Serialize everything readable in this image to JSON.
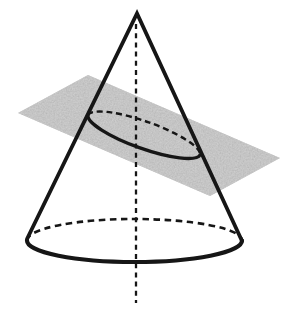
{
  "figure": {
    "type": "cone-plane-intersection",
    "canvas": {
      "width": 301,
      "height": 313
    },
    "colors": {
      "background": "#ffffff",
      "line": "#161616",
      "plane_fill": "#b1b1b1"
    },
    "plane": {
      "points": "88,75 280,158 210,196 18,113"
    },
    "cone": {
      "outline_path": "M 27 239 L 137 13.5 L 242 241",
      "base_front_path": "M 27 240.5 A 107.5 21.5 0 0 0 242 240.5",
      "base_back_path": "M 27 240.5 A 107.5 21.5 0 0 1 242 240.5"
    },
    "section_ellipse": {
      "front_path": "M 88 115 A 59.5 14 19.6 0 0 200 155",
      "back_path": "M 88 115 A 59.5 14 19.6 0 1 200 155"
    },
    "axis": {
      "path": "M 136 24 L 136 303"
    }
  }
}
